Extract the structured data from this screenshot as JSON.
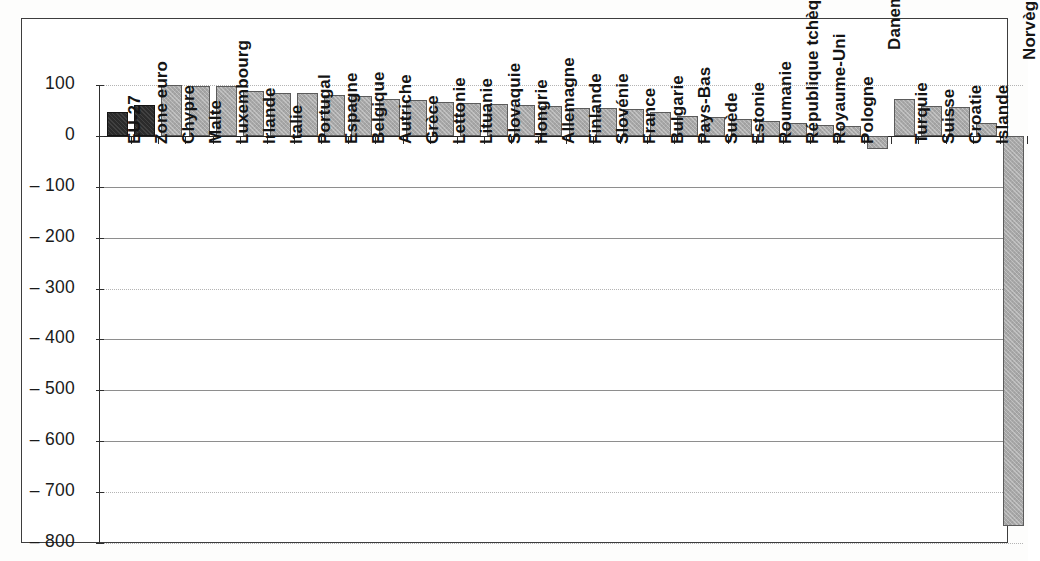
{
  "chart_data": {
    "type": "bar",
    "title": "",
    "subtitle": "",
    "xlabel": "",
    "ylabel": "",
    "ylim": [
      -800,
      100
    ],
    "ytick_values": [
      100,
      0,
      -100,
      -200,
      -300,
      -400,
      -500,
      -600,
      -700,
      -800
    ],
    "ytick_labels": [
      "100",
      "0",
      "– 100",
      "– 200",
      "– 300",
      "– 400",
      "– 500",
      "– 600",
      "– 700",
      "– 800"
    ],
    "grid": true,
    "legend": "none",
    "categories": [
      "EU-27",
      "Zone euro",
      "Chypre",
      "Malte",
      "Luxembourg",
      "Irlande",
      "Italie",
      "Portugal",
      "Espagne",
      "Belgique",
      "Autriche",
      "Grèce",
      "Lettonie",
      "Lituanie",
      "Slovaquie",
      "Hongrie",
      "Allemagne",
      "Finlande",
      "Slovénie",
      "France",
      "Bulgarie",
      "Pays-Bas",
      "Suède",
      "Estonie",
      "Roumanie",
      "République tchèque",
      "Royaume-Uni",
      "Pologne",
      "Danemark",
      "Turquie",
      "Suisse",
      "Croatie",
      "Islande",
      "Norvège"
    ],
    "values": [
      47,
      60,
      100,
      99,
      99,
      89,
      85,
      84,
      81,
      78,
      72,
      71,
      66,
      64,
      62,
      60,
      59,
      55,
      54,
      52,
      47,
      40,
      38,
      34,
      29,
      26,
      22,
      19,
      -26,
      72,
      58,
      57,
      25,
      -767
    ],
    "series": [
      {
        "name": "Valeur",
        "values": [
          47,
          60,
          100,
          99,
          99,
          89,
          85,
          84,
          81,
          78,
          72,
          71,
          66,
          64,
          62,
          60,
          59,
          55,
          54,
          52,
          47,
          40,
          38,
          34,
          29,
          26,
          22,
          19,
          -26,
          72,
          58,
          57,
          25,
          -767
        ]
      }
    ],
    "bar_styles": [
      "dark",
      "dark",
      "light",
      "light",
      "light",
      "light",
      "light",
      "light",
      "light",
      "light",
      "light",
      "light",
      "light",
      "light",
      "light",
      "light",
      "light",
      "light",
      "light",
      "light",
      "light",
      "light",
      "light",
      "light",
      "light",
      "light",
      "light",
      "light",
      "light",
      "light",
      "light",
      "light",
      "light",
      "light"
    ],
    "colors": {
      "bar_light": "#a8a8a8",
      "bar_dark": "#2b2b2b",
      "bar_border": "#5b5b5b",
      "grid": "#8e8e8e",
      "axis": "#2e2e2e",
      "frame": "#3d3d3d",
      "background": "#ffffff",
      "text": "#141414"
    }
  }
}
